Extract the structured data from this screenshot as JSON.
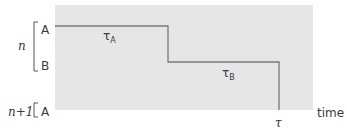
{
  "diagram": {
    "group_n": {
      "label": "n",
      "rows": [
        "A",
        "B"
      ]
    },
    "group_n1": {
      "label": "n+1",
      "rows": [
        "A"
      ]
    },
    "tau_a": {
      "symbol": "τ",
      "subscript": "A"
    },
    "tau_b": {
      "symbol": "τ",
      "subscript": "B"
    },
    "tau_total": "τ",
    "axis_label": "time",
    "colors": {
      "panel": "#e6e6e6",
      "line": "#7a7a7a",
      "text": "#3a3a3a"
    }
  }
}
